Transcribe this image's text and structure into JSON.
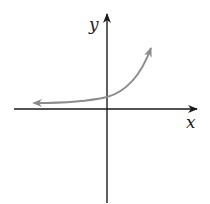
{
  "diagram": {
    "type": "function-graph",
    "axes": {
      "x_label": "x",
      "y_label": "y"
    },
    "colors": {
      "axes": "#1a1a1a",
      "curve": "#8c8c8c",
      "background": "#ffffff"
    }
  }
}
